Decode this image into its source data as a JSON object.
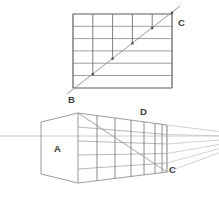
{
  "figure": {
    "background_color": "#ffffff",
    "line_color": "#8a8a8a",
    "line_color_dark": "#6b6b6b",
    "line_color_light": "#b9b9b9",
    "label_color": "#3a3a3a"
  },
  "labels": {
    "a": "A",
    "b": "B",
    "c_top": "C",
    "c_bottom": "C",
    "d": "D"
  },
  "top_panel": {
    "name": "elevation-grid",
    "description": "Rectangular grid with measuring diagonal from B to C",
    "rect": {
      "x": 73,
      "y": 14,
      "width": 99,
      "height": 74
    },
    "rows": 6,
    "columns": 5,
    "horizontal_line_y": [
      14,
      26.3,
      38.6,
      50.9,
      63.2,
      75.5,
      88
    ],
    "vertical_line_x": [
      73,
      92.8,
      112.6,
      132.4,
      152.2,
      172
    ],
    "diagonal": {
      "x1": 67,
      "y1": 94,
      "x2": 178,
      "y2": 8
    },
    "diagonal_label_start": "B",
    "diagonal_label_end": "C",
    "intersection_points": [
      {
        "x": 92.8,
        "y": 74.1
      },
      {
        "x": 112.6,
        "y": 58.7
      },
      {
        "x": 132.4,
        "y": 43.4
      },
      {
        "x": 152.2,
        "y": 28.1
      },
      {
        "x": 172.0,
        "y": 12.8
      }
    ]
  },
  "bottom_panel": {
    "name": "one-point-perspective-box",
    "description": "One point perspective box with horizon line and vanishing point off right edge",
    "horizon_y": 136,
    "vanishing_point": {
      "x": 300,
      "y": 136
    },
    "front_face": {
      "name": "left-face-A",
      "corners": [
        {
          "x": 41,
          "y": 122
        },
        {
          "x": 78,
          "y": 113
        },
        {
          "x": 78,
          "y": 183
        },
        {
          "x": 41,
          "y": 174
        }
      ]
    },
    "side_face": {
      "name": "right-face-grid",
      "top_front": {
        "x": 78,
        "y": 113
      },
      "top_back": {
        "x": 167,
        "y": 125
      },
      "bottom_front": {
        "x": 78,
        "y": 183
      },
      "bottom_back": {
        "x": 167,
        "y": 172
      },
      "vertical_divisions_x": [
        78,
        97,
        115,
        131,
        144,
        155,
        162,
        167
      ],
      "horizontal_rows": 5,
      "diagonal": {
        "from": "top-front",
        "to": "bottom-back"
      }
    },
    "convergence_lines": 5,
    "label_positions": {
      "a": {
        "x": 57,
        "y": 148
      },
      "b": {
        "x": 70,
        "y": 100
      },
      "c_top": {
        "x": 178,
        "y": 23
      },
      "c_bottom": {
        "x": 170,
        "y": 169
      },
      "d": {
        "x": 143,
        "y": 112
      }
    }
  }
}
